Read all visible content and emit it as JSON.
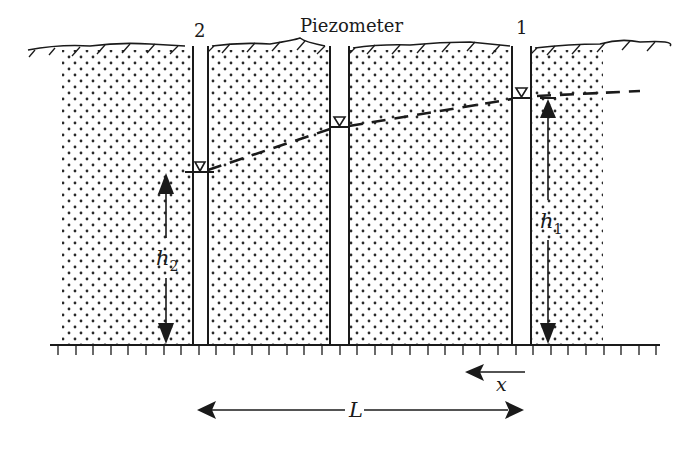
{
  "title_label": "Piezometer",
  "piezometers": [
    {
      "id": "p2",
      "label": "2",
      "x_left": 193,
      "x_right": 208,
      "water_level_y": 172
    },
    {
      "id": "pm",
      "label": "",
      "x_left": 330,
      "x_right": 349,
      "water_level_y": 127
    },
    {
      "id": "p1",
      "label": "1",
      "x_left": 512,
      "x_right": 531,
      "water_level_y": 97
    }
  ],
  "soil_blocks": [
    {
      "x": 62,
      "w": 131
    },
    {
      "x": 208,
      "w": 122
    },
    {
      "x": 349,
      "w": 163
    },
    {
      "x": 531,
      "w": 72
    }
  ],
  "head_labels": {
    "h2": {
      "base": "h",
      "sub": "2"
    },
    "h1": {
      "base": "h",
      "sub": "1"
    }
  },
  "direction_label": "x",
  "length_label": "L",
  "colors": {
    "ink": "#1a1a1a",
    "soil_dot": "#2a2a2a",
    "background": "#ffffff"
  }
}
